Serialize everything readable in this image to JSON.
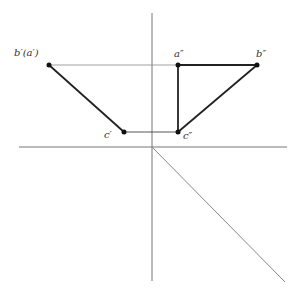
{
  "diagram": {
    "type": "orthographic-projection",
    "axes": {
      "vertical": {
        "x": 152,
        "y1": 13,
        "y2": 281
      },
      "horizontal": {
        "y": 147,
        "x1": 19,
        "x2": 287
      },
      "diagonal_45": {
        "x1": 152,
        "y1": 147,
        "x2": 285,
        "y2": 282
      }
    },
    "points": [
      {
        "id": "b_prime_a_prime",
        "label": "b′(a′)",
        "x": 49,
        "y": 65,
        "label_x": 14,
        "label_y": 56
      },
      {
        "id": "c_prime",
        "label": "c′",
        "x": 124,
        "y": 132,
        "label_x": 104,
        "label_y": 138
      },
      {
        "id": "a_double_prime",
        "label": "a″",
        "x": 178,
        "y": 65,
        "label_x": 174,
        "label_y": 57
      },
      {
        "id": "b_double_prime",
        "label": "b″",
        "x": 257,
        "y": 65,
        "label_x": 256,
        "label_y": 57
      },
      {
        "id": "c_double_prime",
        "label": "c″",
        "x": 178,
        "y": 132,
        "label_x": 183,
        "label_y": 139
      }
    ],
    "projection_lines": [
      {
        "from": "b_prime_a_prime",
        "to": "a_double_prime"
      },
      {
        "from": "c_prime",
        "to": "c_double_prime"
      }
    ],
    "object_edges": [
      {
        "from": "b_prime_a_prime",
        "to": "c_prime"
      },
      {
        "from": "a_double_prime",
        "to": "b_double_prime"
      },
      {
        "from": "a_double_prime",
        "to": "c_double_prime"
      },
      {
        "from": "b_double_prime",
        "to": "c_double_prime"
      }
    ],
    "colors": {
      "axis": "#777777",
      "projection": "#888888",
      "edge": "#222222",
      "point": "#111111"
    }
  }
}
